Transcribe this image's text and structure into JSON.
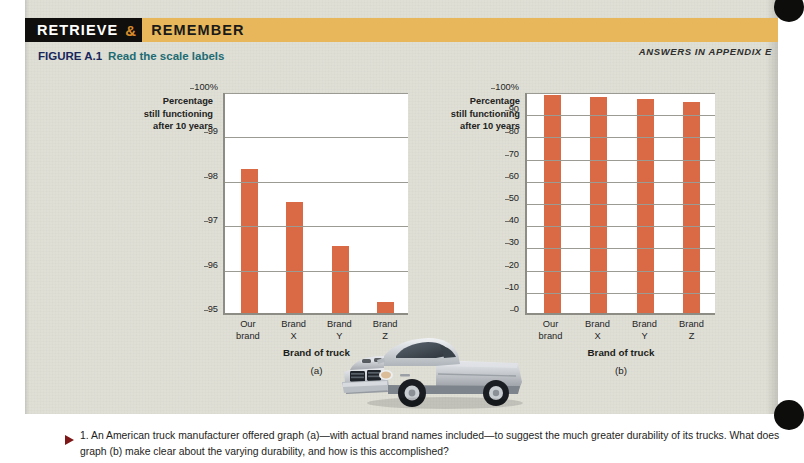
{
  "header": {
    "label_retrieve": "RETRIEVE",
    "label_amp": "&",
    "label_remember": "REMEMBER",
    "answers_note": "ANSWERS IN APPENDIX E",
    "band_color": "#e8b75b",
    "black_color": "#100f0d",
    "amp_color": "#d98b2b"
  },
  "figure": {
    "number": "FIGURE A.1",
    "title": "Read the scale labels",
    "number_color": "#17275c",
    "title_color": "#1d6b73"
  },
  "photo": {
    "credit": "Transtock/SuperStock",
    "alt_name": "silver-pickup-truck-photo"
  },
  "footer": {
    "question": "1. An American truck manufacturer offered graph (a)—with actual brand names included—to suggest the much greater durability of its trucks. What does graph (b) make clear about the varying durability, and how is this accomplished?",
    "marker_color": "#7e1818"
  },
  "chart_data": [
    {
      "id": "a",
      "type": "bar",
      "title": "",
      "panel_label": "(a)",
      "ylabel": "Percentage still functioning after 10 years",
      "ylabel_lines": [
        "Percentage",
        "still functioning",
        "after 10 years"
      ],
      "xlabel": "Brand of truck",
      "categories": [
        "Our brand",
        "Brand X",
        "Brand Y",
        "Brand Z"
      ],
      "category_lines": [
        [
          "Our",
          "brand"
        ],
        [
          "Brand",
          "X"
        ],
        [
          "Brand",
          "Y"
        ],
        [
          "Brand",
          "Z"
        ]
      ],
      "values": [
        98.25,
        97.5,
        96.5,
        95.25
      ],
      "ylim": [
        95,
        100
      ],
      "yticks": [
        100,
        99,
        98,
        97,
        96,
        95
      ],
      "ytick_labels": [
        "100%",
        "99",
        "98",
        "97",
        "96",
        "95"
      ],
      "grid": true,
      "legend": "none",
      "bar_color": "#d96a45"
    },
    {
      "id": "b",
      "type": "bar",
      "title": "",
      "panel_label": "(b)",
      "ylabel": "Percentage still functioning after 10 years",
      "ylabel_lines": [
        "Percentage",
        "still functioning",
        "after 10 years"
      ],
      "xlabel": "Brand of truck",
      "categories": [
        "Our brand",
        "Brand X",
        "Brand Y",
        "Brand Z"
      ],
      "category_lines": [
        [
          "Our",
          "brand"
        ],
        [
          "Brand",
          "X"
        ],
        [
          "Brand",
          "Y"
        ],
        [
          "Brand",
          "Z"
        ]
      ],
      "values": [
        98.25,
        97.5,
        96.5,
        95.25
      ],
      "ylim": [
        0,
        100
      ],
      "yticks": [
        100,
        90,
        80,
        70,
        60,
        50,
        40,
        30,
        20,
        10,
        0
      ],
      "ytick_labels": [
        "100%",
        "90",
        "80",
        "70",
        "60",
        "50",
        "40",
        "30",
        "20",
        "10",
        "0"
      ],
      "grid": true,
      "legend": "none",
      "bar_color": "#d96a45"
    }
  ]
}
